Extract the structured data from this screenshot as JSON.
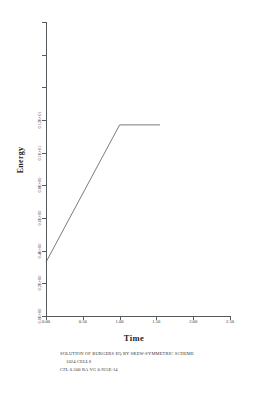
{
  "chart_data": {
    "type": "line",
    "title": "",
    "xlabel": "Time",
    "ylabel": "Energy",
    "xlim": [
      0.0,
      2.5
    ],
    "ylim": [
      0.0,
      1.8
    ],
    "grid": false,
    "legend": null,
    "x_ticks": [
      {
        "value": 0.0,
        "label": "0.00"
      },
      {
        "value": 0.5,
        "label": "0.50"
      },
      {
        "value": 1.0,
        "label": "1.00"
      },
      {
        "value": 1.5,
        "label": "1.50"
      },
      {
        "value": 2.0,
        "label": "2.00"
      },
      {
        "value": 2.5,
        "label": "2.50"
      }
    ],
    "y_ticks": [
      {
        "value": 0.0,
        "label": "0.0E+00"
      },
      {
        "value": 0.2,
        "label": ""
      },
      {
        "value": 0.2,
        "label": "0.2E+00"
      },
      {
        "value": 0.4,
        "label": ""
      },
      {
        "value": 0.4,
        "label": "0.4E+00"
      },
      {
        "value": 0.6,
        "label": ""
      },
      {
        "value": 0.6,
        "label": "0.6E+00"
      },
      {
        "value": 0.8,
        "label": ""
      },
      {
        "value": 0.8,
        "label": "0.8E+00"
      },
      {
        "value": 1.0,
        "label": ""
      }
    ],
    "y_ticks_resolved": [
      {
        "value": 0.0,
        "label": "0.0E+00",
        "labeled": true
      },
      {
        "value": 0.2,
        "label": "0.2E+00",
        "labeled": true
      },
      {
        "value": 0.4,
        "label": "0.4E+00",
        "labeled": true
      },
      {
        "value": 0.6,
        "label": "0.6E+00",
        "labeled": true
      },
      {
        "value": 0.8,
        "label": "0.8E+00",
        "labeled": true
      },
      {
        "value": 1.0,
        "label": "0.1E+01",
        "labeled": true
      },
      {
        "value": 1.2,
        "label": "0.12E+01",
        "labeled": true
      },
      {
        "value": 1.4,
        "label": "",
        "labeled": false
      },
      {
        "value": 1.6,
        "label": "",
        "labeled": false
      },
      {
        "value": 1.8,
        "label": "",
        "labeled": false
      }
    ],
    "series": [
      {
        "name": "energy",
        "x": [
          0.0,
          1.0,
          1.55
        ],
        "values": [
          0.33,
          1.17,
          1.17
        ]
      }
    ]
  },
  "axis_titles": {
    "y": "Energy",
    "x": "Time"
  },
  "caption": {
    "line1": "SOLUTION OF BURGERS EQ BY SKEW-SYMMETRIC SCHEME",
    "line2": "1024  CELLS",
    "line3": "CFL  0.500  RA VG 0.925E-14"
  },
  "style": {
    "line_color": "#555a5e",
    "axis_color": "#555a5e",
    "text_color": "#333333",
    "background": "#ffffff"
  }
}
